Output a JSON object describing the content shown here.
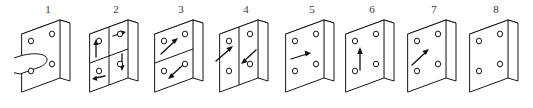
{
  "diagram": {
    "background_color": "#ffffff",
    "line_color": "#161616",
    "panel_count": 8,
    "panels": [
      {
        "label": "1",
        "name": "plate-with-peg",
        "holes": 4,
        "divisions": "none",
        "arrows": [],
        "has_peg": true,
        "peg_direction": "left"
      },
      {
        "label": "2",
        "name": "plate-quadrants-four-arrows",
        "holes": 4,
        "divisions": "quadrants",
        "arrows": [
          "up",
          "right",
          "left",
          "down"
        ],
        "has_peg": false,
        "peg_direction": ""
      },
      {
        "label": "3",
        "name": "plate-horizontal-split-two-arrows",
        "holes": 4,
        "divisions": "horizontal",
        "arrows": [
          "up-right",
          "down-left"
        ],
        "has_peg": false,
        "peg_direction": ""
      },
      {
        "label": "4",
        "name": "plate-vertical-split-two-arrows",
        "holes": 4,
        "divisions": "vertical",
        "arrows": [
          "up-right",
          "down-left"
        ],
        "has_peg": false,
        "peg_direction": ""
      },
      {
        "label": "5",
        "name": "plate-single-right-arrow",
        "holes": 4,
        "divisions": "none",
        "arrows": [
          "right"
        ],
        "has_peg": false,
        "peg_direction": ""
      },
      {
        "label": "6",
        "name": "plate-single-up-arrow",
        "holes": 4,
        "divisions": "none",
        "arrows": [
          "up"
        ],
        "has_peg": false,
        "peg_direction": ""
      },
      {
        "label": "7",
        "name": "plate-single-diagonal-arrow",
        "holes": 4,
        "divisions": "none",
        "arrows": [
          "up-right"
        ],
        "has_peg": false,
        "peg_direction": ""
      },
      {
        "label": "8",
        "name": "plate-plain",
        "holes": 4,
        "divisions": "none",
        "arrows": [],
        "has_peg": false,
        "peg_direction": ""
      }
    ]
  }
}
